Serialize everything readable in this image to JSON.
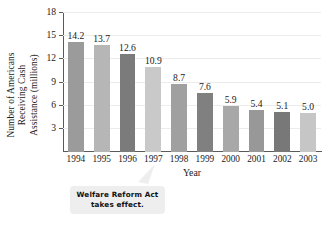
{
  "chart_data": {
    "type": "bar",
    "title": "",
    "xlabel": "Year",
    "ylabel": "Number of Americans Receiving Cash Assistance (millions)",
    "ylabel_lines": [
      "Number of Americans",
      "Receiving Cash",
      "Assistance (millions)"
    ],
    "categories": [
      "1994",
      "1995",
      "1996",
      "1997",
      "1998",
      "1999",
      "2000",
      "2001",
      "2002",
      "2003"
    ],
    "values": [
      14.2,
      13.7,
      12.6,
      10.9,
      8.7,
      7.6,
      5.9,
      5.4,
      5.1,
      5.0
    ],
    "value_labels": [
      "14.2",
      "13.7",
      "12.6",
      "10.9",
      "8.7",
      "7.6",
      "5.9",
      "5.4",
      "5.1",
      "5.0"
    ],
    "bar_colors": [
      "#9b9b9b",
      "#b6b6b6",
      "#7b7b7b",
      "#c9c9c9",
      "#a0a0a0",
      "#808080",
      "#a8a8a8",
      "#989898",
      "#787878",
      "#c6c6c6"
    ],
    "ylim": [
      0,
      18
    ],
    "yticks": [
      3,
      6,
      9,
      12,
      15,
      18
    ],
    "ytick_labels": [
      "3",
      "6",
      "9",
      "12",
      "15",
      "18"
    ],
    "grid": true,
    "legend": "none",
    "annotations": [
      {
        "name": "welfare-reform-callout",
        "line1": "Welfare Reform Act",
        "line2": "takes effect.",
        "points_to": "1997"
      }
    ]
  }
}
